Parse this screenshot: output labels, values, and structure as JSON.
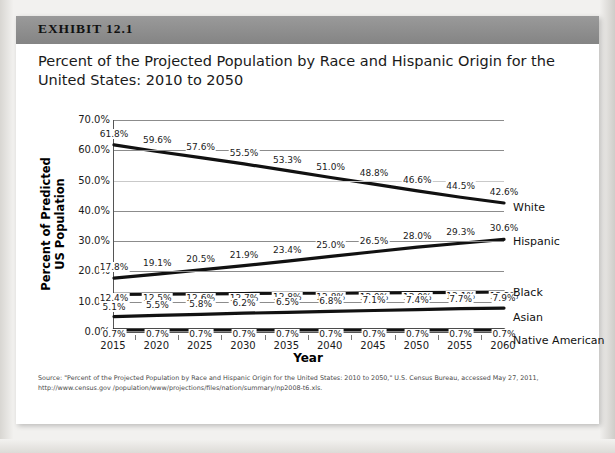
{
  "exhibit": {
    "label": "EXHIBIT 12.1",
    "title": "Percent of the Projected Population by Race and Hispanic Origin for the United States: 2010 to 2050"
  },
  "source": {
    "line1": "Source: \"Percent of the Projected Population by Race and Hispanic Origin for the United States:  2010 to 2050,\" U.S. Census Bureau, accessed May 27, 2011, http://www.census.gov",
    "line2": "/population/www/projections/files/nation/summary/np2008-t6.xls."
  },
  "colors": {
    "header_bar": "#8e8e8e",
    "series_line": "#111111",
    "gridline": "#8c8c8c",
    "axis": "#555555",
    "card": "#ffffff",
    "page": "#f2f1ef"
  },
  "chart_data": {
    "type": "line",
    "title": "Percent of the Projected Population by Race and Hispanic Origin for the United States: 2010 to 2050",
    "xlabel": "Year",
    "ylabel": "Percent of Predicted US Population",
    "x": [
      2015,
      2020,
      2025,
      2030,
      2035,
      2040,
      2045,
      2050,
      2055,
      2060
    ],
    "xtick_labels": [
      "2015",
      "2020",
      "2025",
      "2030",
      "2035",
      "2040",
      "2045",
      "2050",
      "2055",
      "2060"
    ],
    "ylim": [
      0,
      70
    ],
    "ytick_values": [
      0,
      10,
      20,
      30,
      40,
      50,
      60,
      70
    ],
    "ytick_labels": [
      "0.0%",
      "10.0%",
      "20.0%",
      "30.0%",
      "40.0%",
      "50.0%",
      "60.0%",
      "70.0%"
    ],
    "grid": true,
    "legend_position": "right-inline-labels",
    "series": [
      {
        "name": "White",
        "values": [
          61.8,
          59.6,
          57.6,
          55.5,
          53.3,
          51.0,
          48.8,
          46.6,
          44.5,
          42.6
        ],
        "data_labels": [
          "61.8%",
          "59.6%",
          "57.6%",
          "55.5%",
          "53.3%",
          "51.0%",
          "48.8%",
          "46.6%",
          "44.5%",
          "42.6%"
        ]
      },
      {
        "name": "Hispanic",
        "values": [
          17.8,
          19.1,
          20.5,
          21.9,
          23.4,
          25.0,
          26.5,
          28.0,
          29.3,
          30.6
        ],
        "data_labels": [
          "17.8%",
          "19.1%",
          "20.5%",
          "21.9%",
          "23.4%",
          "25.0%",
          "26.5%",
          "28.0%",
          "29.3%",
          "30.6%"
        ]
      },
      {
        "name": "Black",
        "values": [
          12.4,
          12.5,
          12.6,
          12.7,
          12.8,
          12.8,
          12.9,
          13.0,
          13.1,
          13.2
        ],
        "data_labels": [
          "12.4%",
          "12.5%",
          "12.6%",
          "12.7%",
          "12.8%",
          "12.8%",
          "12.9%",
          "13.0%",
          "13.1%",
          "13.2%"
        ]
      },
      {
        "name": "Asian",
        "values": [
          5.1,
          5.5,
          5.8,
          6.2,
          6.5,
          6.8,
          7.1,
          7.4,
          7.7,
          7.9
        ],
        "data_labels": [
          "5.1%",
          "5.5%",
          "5.8%",
          "6.2%",
          "6.5%",
          "6.8%",
          "7.1%",
          "7.4%",
          "7.7%",
          "7.9%"
        ]
      },
      {
        "name": "Native American",
        "values": [
          0.7,
          0.7,
          0.7,
          0.7,
          0.7,
          0.7,
          0.7,
          0.7,
          0.7,
          0.7
        ],
        "data_labels": [
          "0.7%",
          "0.7%",
          "0.7%",
          "0.7%",
          "0.7%",
          "0.7%",
          "0.7%",
          "0.7%",
          "0.7%"
        ]
      }
    ]
  }
}
